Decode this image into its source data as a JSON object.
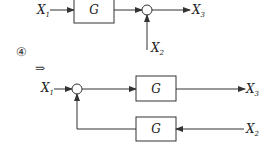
{
  "top_diagram": {
    "input1": {
      "base": "X",
      "sub": "1"
    },
    "block": "G",
    "output": {
      "base": "X",
      "sub": "3"
    },
    "input2": {
      "base": "X",
      "sub": "2"
    }
  },
  "step_marker": "④",
  "implies": "⇒",
  "bottom_diagram": {
    "input1": {
      "base": "X",
      "sub": "1"
    },
    "forward_block": "G",
    "output": {
      "base": "X",
      "sub": "3"
    },
    "feedback_block": "G",
    "input2": {
      "base": "X",
      "sub": "2"
    }
  },
  "colors": {
    "stroke": "#333333",
    "background": "#ffffff"
  }
}
